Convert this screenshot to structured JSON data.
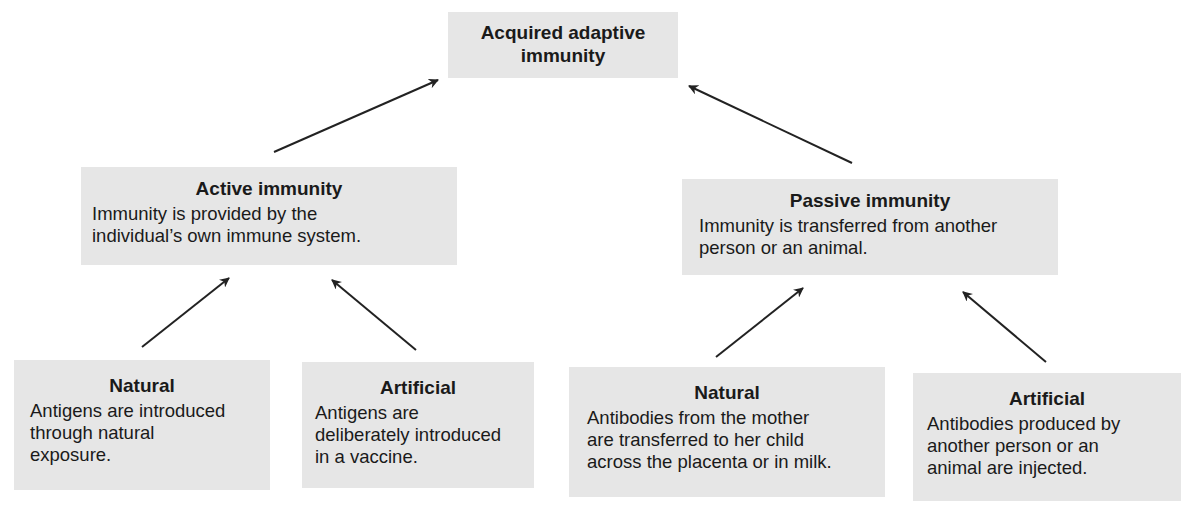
{
  "diagram": {
    "root": {
      "title": "Acquired adaptive immunity",
      "title_line1": "Acquired adaptive",
      "title_line2": "immunity"
    },
    "branches": [
      {
        "title": "Active immunity",
        "description_line1": "Immunity is provided by the",
        "description_line2": "individual’s own immune system.",
        "children": [
          {
            "title": "Natural",
            "description_lines": [
              "Antigens are introduced",
              "through natural",
              "exposure."
            ]
          },
          {
            "title": "Artificial",
            "description_lines": [
              "Antigens are",
              "deliberately introduced",
              "in a vaccine."
            ]
          }
        ]
      },
      {
        "title": "Passive immunity",
        "description_line1": "Immunity is transferred from another",
        "description_line2": "person or an animal.",
        "children": [
          {
            "title": "Natural",
            "description_lines": [
              "Antibodies from the mother",
              "are transferred to her child",
              "across the placenta or in milk."
            ]
          },
          {
            "title": "Artificial",
            "description_lines": [
              "Antibodies produced by",
              "another person or an",
              "animal are injected."
            ]
          }
        ]
      }
    ],
    "colors": {
      "box_fill": "#e6e6e6",
      "text": "#1a1a1a",
      "arrow": "#222222",
      "background": "#ffffff"
    }
  }
}
